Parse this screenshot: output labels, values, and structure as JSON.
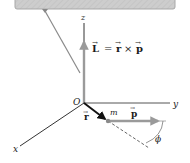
{
  "diagram": {
    "type": "physics-vector-diagram",
    "equation": {
      "L": "L",
      "equals": "=",
      "r": "r",
      "cross": "×",
      "p": "p"
    },
    "axes": {
      "x": "x",
      "y": "y",
      "z": "z",
      "origin": "O"
    },
    "labels": {
      "r_vector": "r",
      "mass": "m",
      "p_vector": "p",
      "angle": "ϕ"
    },
    "colors": {
      "ceiling": "#c9c9c9",
      "ceiling_edge": "#a8a8a8",
      "string": "#8a8a8a",
      "L_arrow": "#9a9a9a",
      "p_arrow": "#9a9a9a",
      "r_arrow": "#111111",
      "axis": "#333333",
      "mass": "#8a8a8a"
    }
  }
}
